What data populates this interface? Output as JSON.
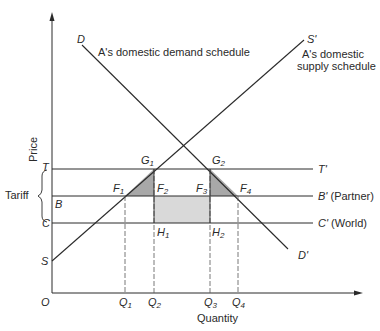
{
  "diagram": {
    "type": "customs-union-trade-diagram",
    "axes": {
      "x_label": "Quantity",
      "y_label": "Price",
      "origin": "O"
    },
    "curves": {
      "demand": {
        "start_label": "D",
        "end_label": "D'",
        "description": "A's domestic demand schedule"
      },
      "supply": {
        "start_label": "S",
        "end_label": "S'",
        "description_line1": "A's domestic",
        "description_line2": "supply schedule"
      }
    },
    "price_lines": [
      {
        "left_label": "T",
        "right_label": "T'",
        "right_note": ""
      },
      {
        "left_label": "B",
        "right_label": "B'",
        "right_note": "(Partner)"
      },
      {
        "left_label": "C",
        "right_label": "C'",
        "right_note": "(World)"
      }
    ],
    "tariff_label": "Tariff",
    "points": {
      "G1": {
        "base": "G",
        "sub": "1"
      },
      "G2": {
        "base": "G",
        "sub": "2"
      },
      "F1": {
        "base": "F",
        "sub": "1"
      },
      "F2": {
        "base": "F",
        "sub": "2"
      },
      "F3": {
        "base": "F",
        "sub": "3"
      },
      "F4": {
        "base": "F",
        "sub": "4"
      },
      "H1": {
        "base": "H",
        "sub": "1"
      },
      "H2": {
        "base": "H",
        "sub": "2"
      }
    },
    "quantities": [
      {
        "base": "Q",
        "sub": "1"
      },
      {
        "base": "Q",
        "sub": "2"
      },
      {
        "base": "Q",
        "sub": "3"
      },
      {
        "base": "Q",
        "sub": "4"
      }
    ],
    "colors": {
      "line": "#2a2a2a",
      "triangle_fill": "#a8a8a8",
      "rect_fill": "#d9d9d9"
    }
  }
}
